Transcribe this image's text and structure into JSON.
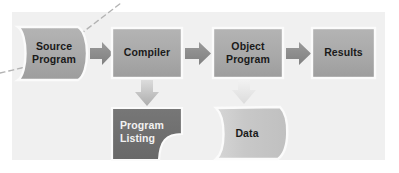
{
  "diagram": {
    "panel": {
      "background_color": "#f0f0f0",
      "x": 12,
      "y": 12,
      "width": 373,
      "height": 148
    },
    "colors": {
      "page_background": "#ffffff",
      "panel_background": "#f0f0f0",
      "node_fill_mid": "#a8a8a8",
      "node_fill_light": "#c9c9c9",
      "node_fill_dark": "#6e6e6e",
      "node_border": "#fbfbfb",
      "arrow_dark": "#8c8c8c",
      "arrow_light": "#e2e2e2",
      "dashed_line": "#b0b0b0",
      "text_dark": "#1a1a1a",
      "text_light": "#f2f2f2"
    },
    "nodes": [
      {
        "id": "source-program",
        "label": "Source\nProgram",
        "shape": "document-curved-sides",
        "fill": "#a8a8a8",
        "text_color": "dark",
        "x": 18,
        "y": 27,
        "width": 72,
        "height": 53
      },
      {
        "id": "compiler",
        "label": "Compiler",
        "shape": "rectangle",
        "fill": "#a8a8a8",
        "text_color": "dark",
        "x": 112,
        "y": 28,
        "width": 70,
        "height": 50
      },
      {
        "id": "object-program",
        "label": "Object\nProgram",
        "shape": "rectangle",
        "fill": "#a8a8a8",
        "text_color": "dark",
        "x": 213,
        "y": 28,
        "width": 70,
        "height": 50
      },
      {
        "id": "results",
        "label": "Results",
        "shape": "rectangle",
        "fill": "#a8a8a8",
        "text_color": "dark",
        "x": 312,
        "y": 28,
        "width": 63,
        "height": 50
      },
      {
        "id": "program-listing",
        "label": "Program\nListing",
        "shape": "page-folded-corner",
        "fill": "#6e6e6e",
        "text_color": "light",
        "x": 112,
        "y": 108,
        "width": 70,
        "height": 52
      },
      {
        "id": "data",
        "label": "Data",
        "shape": "document-wavy-sides",
        "fill": "#c9c9c9",
        "text_color": "dark",
        "x": 214,
        "y": 105,
        "width": 73,
        "height": 55
      }
    ],
    "arrows": [
      {
        "id": "arrow-source-to-compiler",
        "direction": "right",
        "color": "#8c8c8c",
        "from": "source-program",
        "to": "compiler"
      },
      {
        "id": "arrow-compiler-to-object",
        "direction": "right",
        "color": "#8c8c8c",
        "from": "compiler",
        "to": "object-program"
      },
      {
        "id": "arrow-object-to-results",
        "direction": "right",
        "color": "#8c8c8c",
        "from": "object-program",
        "to": "results"
      },
      {
        "id": "arrow-compiler-to-listing",
        "direction": "down",
        "color": "#bdbdbd",
        "from": "compiler",
        "to": "program-listing"
      },
      {
        "id": "arrow-data-to-object",
        "direction": "up",
        "color": "#e2e2e2",
        "from": "data",
        "to": "object-program"
      }
    ],
    "annotations": [
      {
        "id": "callout-dashed-line",
        "type": "dashed-leader-line",
        "color": "#b0b0b0",
        "points": "0,72 28,66 72,40 120,3"
      }
    ]
  }
}
